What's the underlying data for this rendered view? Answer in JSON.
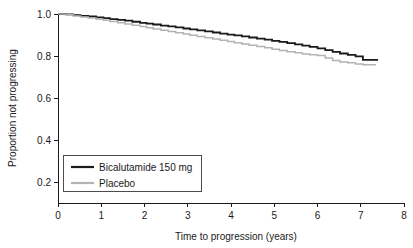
{
  "chart_data": {
    "type": "line",
    "title": "",
    "xlabel": "Time to progression (years)",
    "ylabel": "Proportion not progressing",
    "xlim": [
      0,
      8
    ],
    "ylim": [
      0.1,
      1.0
    ],
    "xticks": [
      0,
      1,
      2,
      3,
      4,
      5,
      6,
      7,
      8
    ],
    "xticklabels": [
      "0",
      "1",
      "2",
      "3",
      "4",
      "5",
      "6",
      "7",
      "8"
    ],
    "yticks": [
      0.2,
      0.4,
      0.6,
      0.8,
      1.0
    ],
    "yticklabels": [
      "0.2",
      "0.4",
      "0.6",
      "0.8",
      "1.0"
    ],
    "grid": false,
    "legend_position": "lower left",
    "series": [
      {
        "name": "Bicalutamide 150 mg",
        "color": "#1a1a1a",
        "linewidth": 1.8,
        "style": "step",
        "x": [
          0.0,
          0.18,
          0.35,
          0.52,
          0.7,
          0.88,
          1.05,
          1.2,
          1.38,
          1.55,
          1.72,
          1.9,
          2.05,
          2.2,
          2.38,
          2.55,
          2.72,
          2.9,
          3.05,
          3.22,
          3.4,
          3.58,
          3.75,
          3.92,
          4.08,
          4.25,
          4.42,
          4.6,
          4.78,
          4.95,
          5.12,
          5.3,
          5.48,
          5.65,
          5.82,
          6.0,
          6.18,
          6.35,
          6.52,
          6.7,
          6.88,
          7.05,
          7.4
        ],
        "y": [
          1.0,
          0.998,
          0.995,
          0.991,
          0.988,
          0.984,
          0.98,
          0.976,
          0.972,
          0.968,
          0.963,
          0.958,
          0.954,
          0.95,
          0.945,
          0.941,
          0.936,
          0.931,
          0.927,
          0.922,
          0.917,
          0.912,
          0.907,
          0.902,
          0.898,
          0.893,
          0.888,
          0.883,
          0.878,
          0.872,
          0.867,
          0.861,
          0.855,
          0.849,
          0.843,
          0.836,
          0.828,
          0.82,
          0.812,
          0.805,
          0.798,
          0.782,
          0.782
        ]
      },
      {
        "name": "Placebo",
        "color": "#b3b3b3",
        "linewidth": 1.5,
        "style": "step",
        "x": [
          0.0,
          0.18,
          0.35,
          0.52,
          0.7,
          0.88,
          1.05,
          1.2,
          1.38,
          1.55,
          1.72,
          1.9,
          2.05,
          2.2,
          2.38,
          2.55,
          2.72,
          2.9,
          3.05,
          3.22,
          3.4,
          3.58,
          3.75,
          3.92,
          4.08,
          4.25,
          4.42,
          4.6,
          4.78,
          4.95,
          5.12,
          5.3,
          5.48,
          5.65,
          5.82,
          6.0,
          6.18,
          6.35,
          6.52,
          6.7,
          6.88,
          7.05,
          7.35
        ],
        "y": [
          1.0,
          0.996,
          0.991,
          0.986,
          0.981,
          0.975,
          0.97,
          0.964,
          0.958,
          0.952,
          0.946,
          0.94,
          0.934,
          0.929,
          0.923,
          0.917,
          0.911,
          0.905,
          0.899,
          0.893,
          0.887,
          0.881,
          0.875,
          0.869,
          0.863,
          0.857,
          0.851,
          0.845,
          0.839,
          0.832,
          0.826,
          0.82,
          0.815,
          0.81,
          0.806,
          0.802,
          0.79,
          0.779,
          0.772,
          0.768,
          0.762,
          0.758,
          0.758
        ]
      }
    ],
    "legend": [
      {
        "label": "Bicalutamide 150 mg",
        "color": "#1a1a1a"
      },
      {
        "label": "Placebo",
        "color": "#b3b3b3"
      }
    ]
  }
}
